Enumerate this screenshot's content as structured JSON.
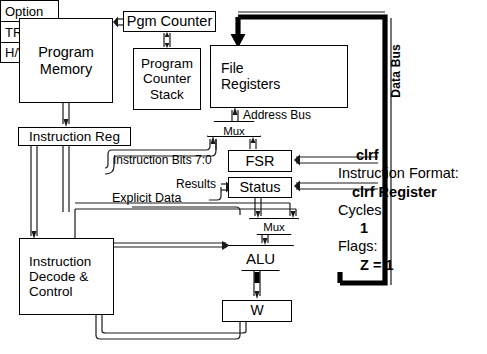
{
  "diagram": {
    "blocks": {
      "program_memory": {
        "line1": "Program",
        "line2": "Memory"
      },
      "pgm_counter": {
        "label": "Pgm Counter"
      },
      "pc_stack": {
        "line1": "Program",
        "line2": "Counter",
        "line3": "Stack"
      },
      "instruction_reg": {
        "label": "Instruction Reg"
      },
      "instruction_decode": {
        "line1": "Instruction",
        "line2": "Decode &",
        "line3": "Control"
      },
      "file_registers": {
        "line1": "File",
        "line2": "Registers"
      },
      "fsr": {
        "label": "FSR"
      },
      "status": {
        "label": "Status"
      },
      "w": {
        "label": "W"
      },
      "address_mux": {
        "label": "Mux"
      },
      "alu_mux": {
        "label": "Mux"
      },
      "alu": {
        "label": "ALU"
      }
    },
    "special_registers": [
      {
        "label": "Option"
      },
      {
        "label": "TRIS"
      },
      {
        "label": "H/W Regs"
      }
    ],
    "bus_labels": {
      "address_bus": "Address Bus",
      "data_bus": "Data Bus",
      "instruction_bits": "Instruction Bits 7:0",
      "results": "Results",
      "explicit_data": "Explicit Data"
    }
  },
  "instruction_info": {
    "mnemonic": "clrf",
    "format_heading": "Instruction Format:",
    "format_value": "clrf Register",
    "cycles_heading": "Cycles:",
    "cycles_value": "1",
    "flags_heading": "Flags:",
    "flags_value": "Z = 1"
  },
  "colors": {
    "line": "#1a1a1a",
    "highlight_bus": "#000000",
    "background": "#ffffff"
  }
}
